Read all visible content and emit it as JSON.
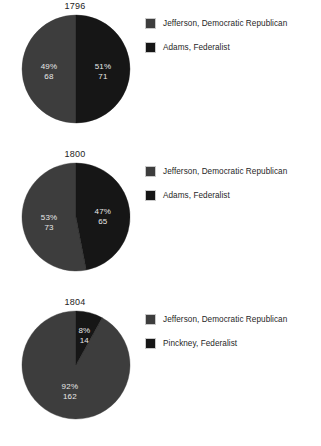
{
  "page": {
    "background": "#ffffff",
    "text_color": "#1a1a1a"
  },
  "palette": {
    "jefferson": "#3d3d3d",
    "federalist": "#161616",
    "slice_label": "#e8e8e8",
    "swatch_border": "#c9c9c9"
  },
  "chart_data": [
    {
      "type": "pie",
      "title": "1796",
      "xlabel": "",
      "ylabel": "",
      "legend_position": "right",
      "categories": [
        "Jefferson, Democratic Republican",
        "Adams, Federalist"
      ],
      "values": [
        68,
        71
      ],
      "percents": [
        49,
        51
      ],
      "slices": [
        {
          "label": "Jefferson, Democratic Republican",
          "percent_text": "49%",
          "value_text": "68",
          "percent": 49,
          "value": 68,
          "color": "#3d3d3d",
          "start_deg": 180,
          "sweep_deg": 180
        },
        {
          "label": "Adams, Federalist",
          "percent_text": "51%",
          "value_text": "71",
          "percent": 51,
          "value": 71,
          "color": "#161616",
          "start_deg": 0,
          "sweep_deg": 180
        }
      ],
      "legend": [
        {
          "label": "Jefferson, Democratic Republican",
          "color": "#3d3d3d"
        },
        {
          "label": "Adams, Federalist",
          "color": "#161616"
        }
      ]
    },
    {
      "type": "pie",
      "title": "1800",
      "xlabel": "",
      "ylabel": "",
      "legend_position": "right",
      "categories": [
        "Jefferson, Democratic Republican",
        "Adams, Federalist"
      ],
      "values": [
        73,
        65
      ],
      "percents": [
        53,
        47
      ],
      "slices": [
        {
          "label": "Jefferson, Democratic Republican",
          "percent_text": "53%",
          "value_text": "73",
          "percent": 53,
          "value": 73,
          "color": "#3d3d3d",
          "start_deg": 169,
          "sweep_deg": 191
        },
        {
          "label": "Adams, Federalist",
          "percent_text": "47%",
          "value_text": "65",
          "percent": 47,
          "value": 65,
          "color": "#161616",
          "start_deg": 0,
          "sweep_deg": 169
        }
      ],
      "legend": [
        {
          "label": "Jefferson, Democratic Republican",
          "color": "#3d3d3d"
        },
        {
          "label": "Adams, Federalist",
          "color": "#161616"
        }
      ]
    },
    {
      "type": "pie",
      "title": "1804",
      "xlabel": "",
      "ylabel": "",
      "legend_position": "right",
      "categories": [
        "Jefferson, Democratic Republican",
        "Pinckney, Federalist"
      ],
      "values": [
        162,
        14
      ],
      "percents": [
        92,
        8
      ],
      "slices": [
        {
          "label": "Jefferson, Democratic Republican",
          "percent_text": "92%",
          "value_text": "162",
          "percent": 92,
          "value": 162,
          "color": "#3d3d3d",
          "start_deg": 29,
          "sweep_deg": 331
        },
        {
          "label": "Pinckney, Federalist",
          "percent_text": "8%",
          "value_text": "14",
          "percent": 8,
          "value": 14,
          "color": "#161616",
          "start_deg": 0,
          "sweep_deg": 29
        }
      ],
      "legend": [
        {
          "label": "Jefferson, Democratic Republican",
          "color": "#3d3d3d"
        },
        {
          "label": "Pinckney, Federalist",
          "color": "#161616"
        }
      ]
    }
  ]
}
